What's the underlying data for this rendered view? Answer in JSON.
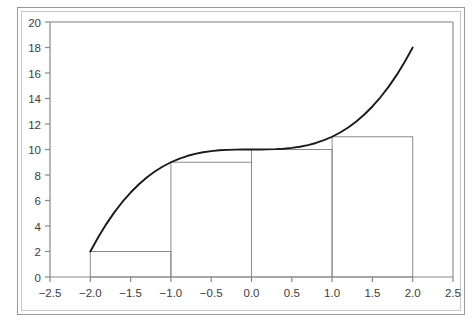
{
  "figure": {
    "background_color": "#ffffff",
    "outer_frame_color": "#9a9a9a",
    "plot_frame_color": "#7a7a7a",
    "axis_color": "#888888",
    "curve_color": "#1a1a1a",
    "rectangle_edge_color": "#8a8a8a",
    "tick_label_color": "#3c3c3c"
  },
  "chart_data": {
    "type": "line",
    "title": "",
    "xlabel": "",
    "ylabel": "",
    "xlim": [
      -2.5,
      2.5
    ],
    "ylim": [
      0,
      20
    ],
    "grid": false,
    "legend_position": "none",
    "x_ticks": [
      -2.5,
      -2.0,
      -1.5,
      -1.0,
      -0.5,
      0.0,
      0.5,
      1.0,
      1.5,
      2.0,
      2.5
    ],
    "x_tick_labels": [
      "-2.5",
      "-2.0",
      "-1.5",
      "-1.0",
      "-0.5",
      "0.0",
      "0.5",
      "1.0",
      "1.5",
      "2.0",
      "2.5"
    ],
    "y_ticks": [
      0,
      2,
      4,
      6,
      8,
      10,
      12,
      14,
      16,
      18,
      20
    ],
    "y_tick_labels": [
      "0",
      "2",
      "4",
      "6",
      "8",
      "10",
      "12",
      "14",
      "16",
      "18",
      "20"
    ],
    "series": [
      {
        "name": "f(x) = x^3 + 10",
        "type": "line",
        "x": [
          -2.0,
          -1.9,
          -1.8,
          -1.7,
          -1.6,
          -1.5,
          -1.4,
          -1.3,
          -1.2,
          -1.1,
          -1.0,
          -0.9,
          -0.8,
          -0.7,
          -0.6,
          -0.5,
          -0.4,
          -0.3,
          -0.2,
          -0.1,
          0.0,
          0.1,
          0.2,
          0.3,
          0.4,
          0.5,
          0.6,
          0.7,
          0.8,
          0.9,
          1.0,
          1.1,
          1.2,
          1.3,
          1.4,
          1.5,
          1.6,
          1.7,
          1.8,
          1.9,
          2.0
        ],
        "y": [
          2.0,
          3.141,
          4.168,
          5.087,
          5.904,
          6.625,
          7.256,
          7.803,
          8.272,
          8.669,
          9.0,
          9.271,
          9.488,
          9.657,
          9.784,
          9.875,
          9.936,
          9.973,
          9.992,
          9.999,
          10.0,
          10.001,
          10.008,
          10.027,
          10.064,
          10.125,
          10.216,
          10.343,
          10.512,
          10.729,
          11.0,
          11.331,
          11.728,
          12.197,
          12.744,
          13.375,
          14.096,
          14.913,
          15.832,
          16.859,
          18.0
        ]
      },
      {
        "name": "Left-endpoint Riemann rectangles",
        "type": "bar",
        "bar_width": 1.0,
        "bar_left_edges": [
          -2.0,
          -1.0,
          0.0,
          1.0
        ],
        "bar_right_edges": [
          -1.0,
          0.0,
          1.0,
          2.0
        ],
        "bar_heights": [
          2.0,
          9.0,
          10.0,
          11.0
        ],
        "bar_labels": [
          "f(-2)=2",
          "f(-1)=9",
          "f(0)=10",
          "f(1)=11"
        ]
      }
    ],
    "annotations": []
  }
}
